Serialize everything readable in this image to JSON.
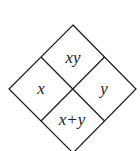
{
  "diagram": {
    "shape": "diamond divided into four cells",
    "cells": {
      "top": "xy",
      "left": "x",
      "right": "y",
      "bottom": "x+y"
    },
    "line_color": "#1a1a1a"
  }
}
